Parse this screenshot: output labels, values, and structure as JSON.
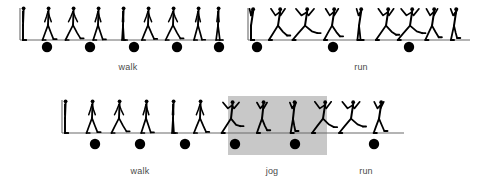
{
  "figure": {
    "title_visible": false,
    "background_color": "#ffffff",
    "stroke_color": "#000000",
    "baseline_color": "#6b6b6b",
    "dot_color": "#000000",
    "highlight_color": "#c8c8c8",
    "caption_color": "#4a4a4a"
  },
  "rows": [
    {
      "id": "top-row",
      "sequences": [
        {
          "id": "top-walk",
          "label": "walk",
          "gait": "walk",
          "figure_count": 9,
          "dot_count": 5,
          "highlighted": false,
          "axis": {
            "x": 20,
            "y_top": 8,
            "y_base": 40,
            "width": 203
          },
          "figures_x": [
            23,
            48,
            73,
            98,
            123,
            148,
            173,
            198,
            218
          ],
          "dots_x": [
            47,
            90,
            134,
            177,
            219
          ],
          "dot_y": 47,
          "dot_radius": 5.2,
          "caption_x": 128,
          "caption_y": 62
        },
        {
          "id": "top-run",
          "label": "run",
          "gait": "run",
          "figure_count": 9,
          "dot_count": 3,
          "highlighted": false,
          "axis": {
            "x": 248,
            "y_top": 8,
            "y_base": 40,
            "width": 222
          },
          "figures_x": [
            251,
            278,
            305,
            332,
            359,
            386,
            410,
            432,
            454
          ],
          "dots_x": [
            257,
            333,
            409
          ],
          "dot_y": 47,
          "dot_radius": 5.2,
          "caption_x": 361,
          "caption_y": 62
        }
      ]
    },
    {
      "id": "bottom-row",
      "sequences": [
        {
          "id": "bottom-continuous",
          "gait": "walk-jog-run",
          "figure_count": 15,
          "dot_count": 6,
          "axis": {
            "x": 62,
            "y_top": 100,
            "y_base": 133,
            "width": 342
          },
          "figures_x": [
            65,
            92,
            119,
            146,
            173,
            200,
            231,
            262,
            293,
            323,
            351,
            379
          ],
          "dots_x": [
            95,
            140,
            185,
            235,
            295,
            374
          ],
          "dot_y": 144,
          "dot_radius": 5.2,
          "segments": [
            {
              "label": "walk",
              "gait": "walk",
              "caption_x": 140,
              "caption_y": 166,
              "highlighted": false
            },
            {
              "label": "jog",
              "gait": "jog",
              "caption_x": 272,
              "caption_y": 166,
              "highlighted": true
            },
            {
              "label": "run",
              "gait": "run",
              "caption_x": 366,
              "caption_y": 166,
              "highlighted": false
            }
          ],
          "highlight": {
            "x": 228,
            "y": 96,
            "width": 99,
            "height": 59
          }
        }
      ]
    }
  ],
  "captions": {
    "top_walk": "walk",
    "top_run": "run",
    "bottom_walk": "walk",
    "bottom_jog": "jog",
    "bottom_run": "run"
  }
}
